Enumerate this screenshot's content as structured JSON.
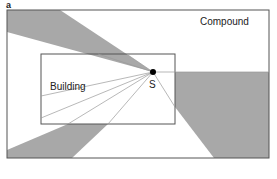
{
  "figure": {
    "panel_label": "a",
    "labels": {
      "compound": "Compound",
      "building": "Building",
      "source": "S"
    },
    "colors": {
      "shade": "#a8a8a8",
      "outline": "#555555",
      "ray": "#9a9a9a",
      "point": "#000000"
    }
  }
}
